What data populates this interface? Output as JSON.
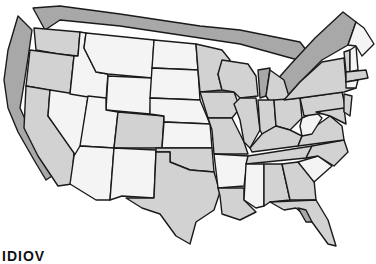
{
  "map": {
    "title": "United States map",
    "colors": {
      "white_states": "#f4f4f4",
      "light_states": "#d2d2d2",
      "border_band": "#a8a8a8",
      "outline": "#1a1a1a"
    },
    "legend_categories": [
      "white",
      "light gray",
      "medium gray border band"
    ]
  },
  "caption": {
    "text": "IDIOV"
  }
}
